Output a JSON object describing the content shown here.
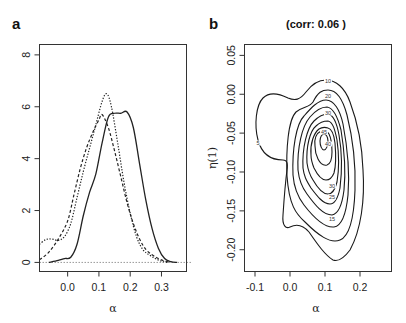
{
  "chart_data": [
    {
      "panel": "a",
      "type": "line",
      "title": "",
      "xlabel": "α",
      "ylabel": "",
      "xlim": [
        -0.09,
        0.38
      ],
      "ylim": [
        -0.35,
        8.4
      ],
      "xticks": [
        "0.0",
        "0.1",
        "0.2",
        "0.3"
      ],
      "xtick_values": [
        0.0,
        0.1,
        0.2,
        0.3
      ],
      "yticks": [
        "0",
        "2",
        "4",
        "6",
        "8"
      ],
      "ytick_values": [
        0,
        2,
        4,
        6,
        8
      ],
      "grid": false,
      "reference_line": {
        "y": 0,
        "style": "dotted",
        "color": "#999999"
      },
      "series": [
        {
          "name": "solid",
          "style": "solid",
          "x": [
            -0.06,
            -0.03,
            -0.01,
            0.01,
            0.03,
            0.05,
            0.07,
            0.09,
            0.11,
            0.13,
            0.15,
            0.17,
            0.19,
            0.21,
            0.23,
            0.25,
            0.27,
            0.29,
            0.31,
            0.33,
            0.35
          ],
          "y": [
            0.0,
            0.08,
            0.15,
            0.2,
            0.7,
            1.8,
            2.7,
            3.4,
            4.6,
            5.6,
            5.75,
            5.75,
            5.8,
            5.2,
            3.8,
            2.4,
            1.3,
            0.55,
            0.15,
            0.03,
            0.0
          ]
        },
        {
          "name": "dashed",
          "style": "dashed",
          "x": [
            -0.09,
            -0.06,
            -0.03,
            0.0,
            0.02,
            0.04,
            0.06,
            0.08,
            0.1,
            0.11,
            0.13,
            0.15,
            0.17,
            0.19,
            0.21,
            0.23,
            0.25,
            0.27,
            0.29,
            0.31,
            0.33
          ],
          "y": [
            0.1,
            0.4,
            0.9,
            1.6,
            2.6,
            3.6,
            4.4,
            5.0,
            5.5,
            5.7,
            5.2,
            4.3,
            3.3,
            2.3,
            1.5,
            0.9,
            0.5,
            0.3,
            0.15,
            0.05,
            0.0
          ]
        },
        {
          "name": "dotted",
          "style": "dotted",
          "x": [
            -0.09,
            -0.07,
            -0.05,
            -0.03,
            -0.01,
            0.01,
            0.03,
            0.05,
            0.07,
            0.09,
            0.11,
            0.125,
            0.14,
            0.16,
            0.18,
            0.2,
            0.22,
            0.24,
            0.26,
            0.28,
            0.3,
            0.32
          ],
          "y": [
            0.7,
            0.88,
            0.9,
            0.85,
            1.0,
            1.5,
            2.5,
            3.5,
            4.4,
            5.3,
            6.2,
            6.5,
            6.0,
            4.6,
            3.1,
            1.9,
            1.0,
            0.5,
            0.3,
            0.15,
            0.05,
            0.0
          ]
        }
      ]
    },
    {
      "panel": "b",
      "type": "contour",
      "title": "(corr:  0.06 )",
      "xlabel": "α",
      "ylabel": "η(1)",
      "xlim": [
        -0.13,
        0.29
      ],
      "ylim": [
        -0.228,
        0.064
      ],
      "xticks": [
        "-0.1",
        "0.0",
        "0.1",
        "0.2"
      ],
      "xtick_values": [
        -0.1,
        0.0,
        0.1,
        0.2
      ],
      "yticks": [
        "0.05",
        "0.00",
        "-0.05",
        "-0.10",
        "-0.15",
        "-0.20"
      ],
      "ytick_values": [
        0.05,
        0.0,
        -0.05,
        -0.1,
        -0.15,
        -0.2
      ],
      "grid": false,
      "contour_levels": [
        5,
        10,
        15,
        20,
        25,
        30,
        35,
        40,
        45
      ],
      "visible_labels": [
        "5",
        "10",
        "20",
        "30",
        "40",
        "45",
        "30",
        "25",
        "15"
      ],
      "center": {
        "x": 0.12,
        "y": -0.045
      }
    }
  ],
  "panels": {
    "a": {
      "letter": "a"
    },
    "b": {
      "letter": "b",
      "title": "(corr:  0.06 )"
    }
  }
}
